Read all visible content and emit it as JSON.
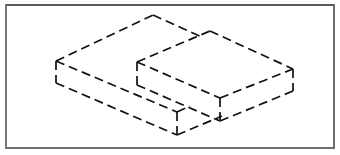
{
  "figure": {
    "colors": {
      "background": "#ffffff",
      "frame": "#6e6e6e",
      "line": "#111111"
    },
    "line_style": "dashed",
    "shapes": [
      {
        "name": "large-box",
        "vertices": {
          "top_back": [
            153,
            15
          ],
          "top_left": [
            56,
            61
          ],
          "top_front": [
            177,
            112
          ],
          "top_right": [
            250,
            80
          ],
          "bottom_left": [
            56,
            83
          ],
          "bottom_front": [
            177,
            135
          ]
        }
      },
      {
        "name": "small-box",
        "vertices": {
          "top_back": [
            210,
            31
          ],
          "top_left": [
            137,
            62
          ],
          "top_front": [
            220,
            98
          ],
          "top_right": [
            293,
            69
          ],
          "bottom_left": [
            137,
            85
          ],
          "bottom_front": [
            220,
            121
          ],
          "bottom_right": [
            293,
            91
          ]
        }
      }
    ]
  }
}
